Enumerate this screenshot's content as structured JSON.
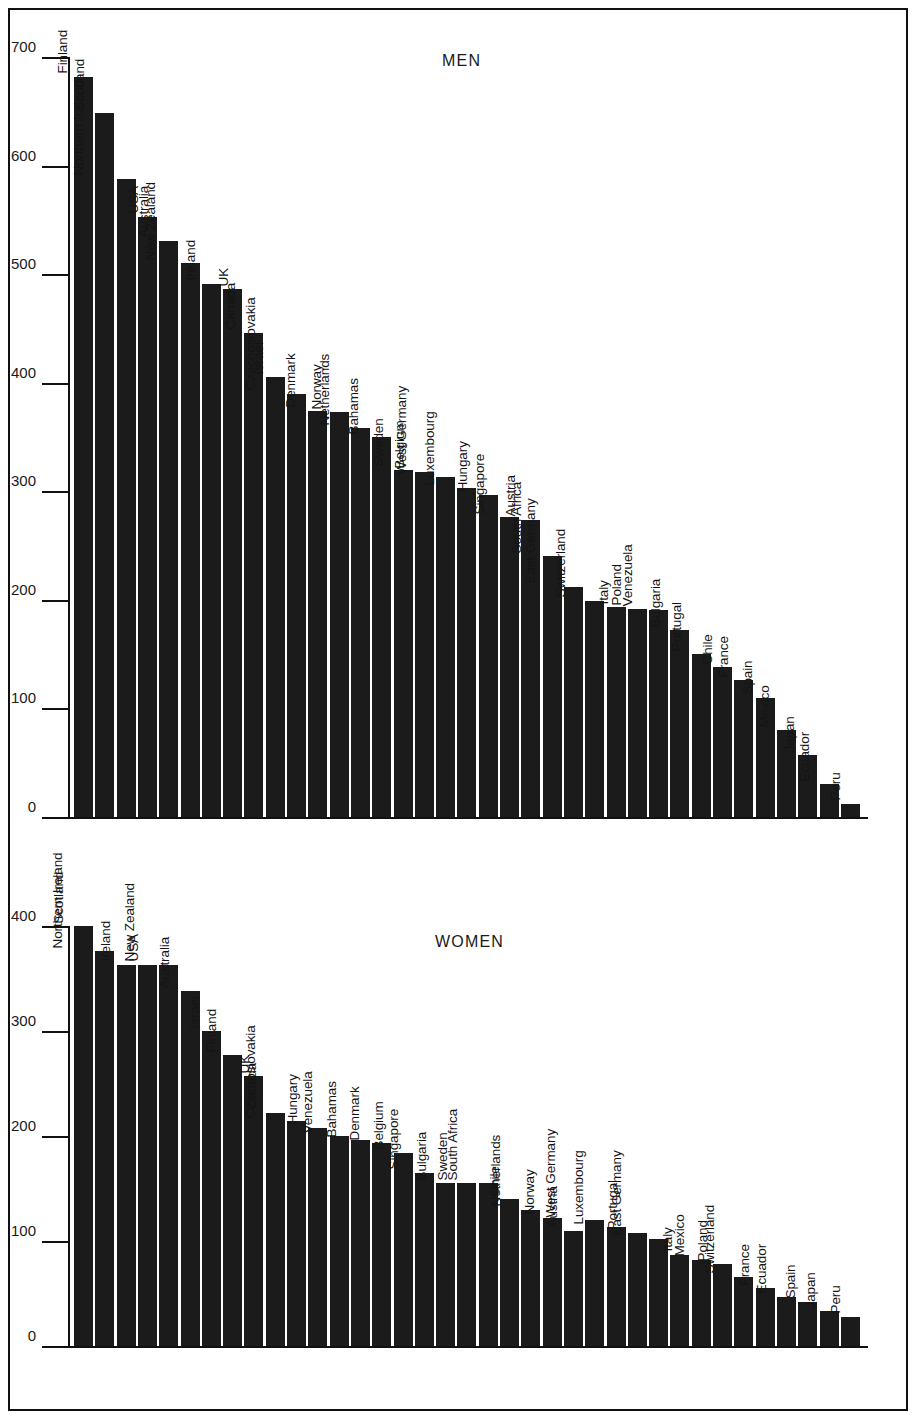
{
  "figure": {
    "background": "#ffffff",
    "bar_color": "#1b1b1b",
    "axis_color": "#111111"
  },
  "chart_data": [
    {
      "type": "bar",
      "title": "MEN",
      "xlabel": "",
      "ylabel": "",
      "ylim": [
        0,
        700
      ],
      "yticks": [
        0,
        100,
        200,
        300,
        400,
        500,
        600,
        700
      ],
      "grid": false,
      "legend": "none",
      "orientation": "vertical",
      "label_rotation": -90,
      "categories": [
        "Finland",
        "Scotland",
        "Northern Ireland",
        "USA",
        "Australia",
        "New Zealand",
        "Ireland",
        "UK",
        "Canada",
        "Israel",
        "Czechoslovakia",
        "Denmark",
        "Norway",
        "Netherlands",
        "Bahamas",
        "Sweden",
        "Belgium",
        "West Germany",
        "Luxembourg",
        "Hungary",
        "Singapore",
        "Austria",
        "South Africa",
        "East Germany",
        "Switzerland",
        "Italy",
        "Poland",
        "Venezuela",
        "Bulgaria",
        "Portugal",
        "Chile",
        "France",
        "Spain",
        "Mexico",
        "Japan",
        "Ecuador",
        "Peru"
      ],
      "values": [
        682,
        648,
        588,
        553,
        531,
        510,
        491,
        486,
        446,
        405,
        390,
        374,
        373,
        358,
        350,
        320,
        318,
        313,
        303,
        297,
        276,
        274,
        240,
        212,
        199,
        193,
        192,
        191,
        172,
        150,
        138,
        126,
        110,
        80,
        57,
        30,
        12
      ]
    },
    {
      "type": "bar",
      "title": "WOMEN",
      "xlabel": "",
      "ylabel": "",
      "ylim": [
        0,
        400
      ],
      "yticks": [
        0,
        100,
        200,
        300,
        400
      ],
      "grid": false,
      "legend": "none",
      "orientation": "vertical",
      "label_rotation": -90,
      "categories": [
        "Scotland",
        "Northern Ireland",
        "Ireland",
        "USA",
        "New Zealand",
        "Australia",
        "Israel",
        "Finland",
        "UK",
        "Canada",
        "Czechoslovakia",
        "Hungary",
        "Venezuela",
        "Bahamas",
        "Denmark",
        "Belgium",
        "Singapore",
        "Bulgaria",
        "Sweden",
        "South Africa",
        "Chile",
        "Netherlands",
        "Norway",
        "Austria",
        "West Germany",
        "Luxembourg",
        "Portugal",
        "East Germany",
        "Italy",
        "Mexico",
        "Poland",
        "Switzerland",
        "France",
        "Ecuador",
        "Spain",
        "Japan",
        "Peru"
      ],
      "values": [
        400,
        376,
        363,
        363,
        363,
        338,
        300,
        277,
        257,
        222,
        214,
        208,
        200,
        196,
        193,
        184,
        165,
        155,
        155,
        155,
        140,
        130,
        122,
        110,
        120,
        113,
        108,
        102,
        87,
        82,
        78,
        66,
        55,
        47,
        42,
        33,
        28
      ]
    }
  ],
  "men": {
    "title": "MEN",
    "axis": {
      "ticks": [
        "700",
        "600",
        "500",
        "400",
        "300",
        "200",
        "100",
        "0"
      ]
    }
  },
  "women": {
    "title": "WOMEN",
    "axis": {
      "ticks": [
        "400",
        "300",
        "200",
        "100",
        "0"
      ]
    }
  }
}
